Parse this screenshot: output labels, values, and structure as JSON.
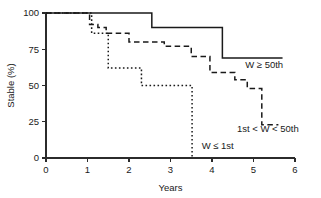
{
  "chart_data": {
    "type": "line",
    "title": "",
    "xlabel": "Years",
    "ylabel": "Stable (%)",
    "xlim": [
      0,
      6
    ],
    "ylim": [
      0,
      100
    ],
    "xticks": [
      0,
      1,
      2,
      3,
      4,
      5,
      6
    ],
    "xtick_labels": [
      "0",
      "1",
      "2",
      "3",
      "4",
      "5",
      "6"
    ],
    "yticks": [
      0,
      25,
      50,
      75,
      100
    ],
    "ytick_labels": [
      "0",
      "25",
      "50",
      "75",
      "100"
    ],
    "grid": false,
    "legend_position": "inline-annotations",
    "series": [
      {
        "name": "W ≥ 50th",
        "style": "solid",
        "annotation": "W ≥ 50th",
        "x": [
          0,
          2.55,
          2.55,
          4.25,
          4.25,
          5.7
        ],
        "y": [
          100,
          100,
          90,
          90,
          69,
          69
        ],
        "steps": [
          {
            "x": 2.55,
            "from": 100,
            "to": 90
          },
          {
            "x": 4.25,
            "from": 90,
            "to": 69
          }
        ]
      },
      {
        "name": "1st < W < 50th",
        "style": "dashed",
        "annotation": "1st < W < 50th",
        "x": [
          0,
          1.05,
          1.05,
          1.25,
          1.25,
          1.45,
          1.45,
          2.0,
          2.0,
          2.85,
          2.85,
          3.5,
          3.5,
          3.95,
          3.95,
          4.55,
          4.55,
          4.85,
          4.85,
          5.2,
          5.2,
          5.6
        ],
        "y": [
          100,
          100,
          92,
          92,
          90,
          90,
          86,
          86,
          80,
          80,
          77,
          77,
          70,
          70,
          59,
          59,
          54,
          54,
          48,
          48,
          23,
          23
        ],
        "steps": [
          {
            "x": 1.05,
            "from": 100,
            "to": 92
          },
          {
            "x": 1.25,
            "from": 92,
            "to": 90
          },
          {
            "x": 1.45,
            "from": 90,
            "to": 86
          },
          {
            "x": 2.0,
            "from": 86,
            "to": 80
          },
          {
            "x": 2.85,
            "from": 80,
            "to": 77
          },
          {
            "x": 3.5,
            "from": 77,
            "to": 70
          },
          {
            "x": 3.95,
            "from": 70,
            "to": 59
          },
          {
            "x": 4.55,
            "from": 59,
            "to": 54
          },
          {
            "x": 4.85,
            "from": 54,
            "to": 48
          },
          {
            "x": 5.2,
            "from": 48,
            "to": 23
          }
        ]
      },
      {
        "name": "W ≤ 1st",
        "style": "dotted",
        "annotation": "W ≤ 1st",
        "x": [
          0,
          1.1,
          1.1,
          1.5,
          1.5,
          2.3,
          2.3,
          3.52,
          3.52
        ],
        "y": [
          100,
          100,
          86,
          86,
          62,
          62,
          50,
          50,
          0
        ],
        "steps": [
          {
            "x": 1.1,
            "from": 100,
            "to": 86
          },
          {
            "x": 1.5,
            "from": 86,
            "to": 62
          },
          {
            "x": 2.3,
            "from": 62,
            "to": 50
          },
          {
            "x": 3.52,
            "from": 50,
            "to": 0
          }
        ]
      }
    ],
    "annotations": [
      {
        "label": "W ≥ 50th",
        "x": 4.8,
        "y": 62,
        "series": "W ≥ 50th"
      },
      {
        "label": "1st < W < 50th",
        "x": 4.6,
        "y": 18,
        "series": "1st < W < 50th"
      },
      {
        "label": "W ≤ 1st",
        "x": 3.75,
        "y": 6,
        "series": "W ≤ 1st"
      }
    ]
  }
}
